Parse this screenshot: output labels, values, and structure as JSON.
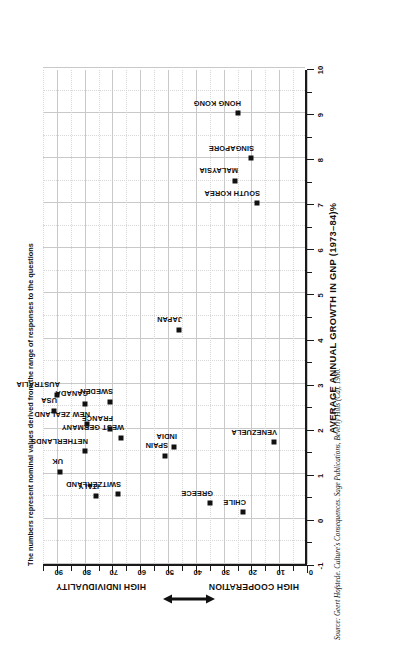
{
  "note": "The numbers represent nominal values derived from the range of responses to the questions",
  "source": "Source: Geert Hofstede. Culture's Consequences. Sage Publications, Beverly Hills (Ca), 1980.",
  "axes": {
    "x_title": "AVERAGE ANNUAL GROWTH IN GNP (1973–84)%",
    "x_ticks": [
      "-1",
      "0",
      "1",
      "2",
      "3",
      "4",
      "5",
      "6",
      "7",
      "8",
      "9",
      "10"
    ],
    "y_ticks": [
      "0",
      "10",
      "20",
      "30",
      "40",
      "50",
      "60",
      "70",
      "80",
      "90"
    ],
    "y_caption_low": "HIGH COOPERATION",
    "y_caption_high": "HIGH INDIVIDUALITY",
    "y_arrow_icon": "double-arrow-icon"
  },
  "chart_data": {
    "type": "scatter",
    "title": "",
    "xlabel": "AVERAGE ANNUAL GROWTH IN GNP (1973–84)%",
    "ylabel": "HIGH COOPERATION ↔ HIGH INDIVIDUALITY",
    "xlim": [
      -1,
      10
    ],
    "ylim": [
      0,
      95
    ],
    "grid": true,
    "legend": "none",
    "points": [
      {
        "label": "VENEZUELA",
        "x": 1.7,
        "y": 12
      },
      {
        "label": "CHILE",
        "x": 0.15,
        "y": 23
      },
      {
        "label": "GREECE",
        "x": 0.35,
        "y": 35
      },
      {
        "label": "SINGAPORE",
        "x": 8.0,
        "y": 20
      },
      {
        "label": "HONG KONG",
        "x": 9.0,
        "y": 25
      },
      {
        "label": "SOUTH KOREA",
        "x": 7.0,
        "y": 18
      },
      {
        "label": "MALAYSIA",
        "x": 7.5,
        "y": 26
      },
      {
        "label": "INDIA",
        "x": 1.6,
        "y": 48
      },
      {
        "label": "SPAIN",
        "x": 1.4,
        "y": 51
      },
      {
        "label": "JAPAN",
        "x": 4.2,
        "y": 46
      },
      {
        "label": "SWITZERLAND",
        "x": 0.55,
        "y": 68
      },
      {
        "label": "WEST GERMANY",
        "x": 1.8,
        "y": 67
      },
      {
        "label": "SWEDEN",
        "x": 2.6,
        "y": 71
      },
      {
        "label": "FRANCE",
        "x": 2.0,
        "y": 71
      },
      {
        "label": "ITALY",
        "x": 0.5,
        "y": 76
      },
      {
        "label": "NETHERLANDS",
        "x": 1.5,
        "y": 80
      },
      {
        "label": "NEW ZEALAND",
        "x": 2.1,
        "y": 79
      },
      {
        "label": "CANADA",
        "x": 2.55,
        "y": 80
      },
      {
        "label": "UK",
        "x": 1.05,
        "y": 89
      },
      {
        "label": "AUSTRALIA",
        "x": 2.75,
        "y": 90
      },
      {
        "label": "USA",
        "x": 2.4,
        "y": 91
      }
    ]
  }
}
